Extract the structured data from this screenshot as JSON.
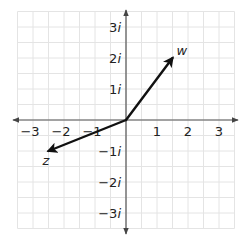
{
  "diagram": {
    "type": "complex-plane",
    "x_range": [
      -3.5,
      3.5
    ],
    "y_range": [
      -3.5,
      3.5
    ],
    "grid_step": 0.5,
    "x_ticks": [
      {
        "value": -3,
        "label": "−3"
      },
      {
        "value": -2,
        "label": "−2"
      },
      {
        "value": -1,
        "label": "−1"
      },
      {
        "value": 1,
        "label": "1"
      },
      {
        "value": 2,
        "label": "2"
      },
      {
        "value": 3,
        "label": "3"
      }
    ],
    "y_ticks": [
      {
        "value": 3,
        "coef": "3",
        "unit": "i"
      },
      {
        "value": 2,
        "coef": "2",
        "unit": "i"
      },
      {
        "value": 1,
        "coef": "1",
        "unit": "i"
      },
      {
        "value": -1,
        "coef": "−1",
        "unit": "i"
      },
      {
        "value": -2,
        "coef": "−2",
        "unit": "i"
      },
      {
        "value": -3,
        "coef": "−3",
        "unit": "i"
      }
    ],
    "vectors": [
      {
        "name": "w",
        "label": "w",
        "re": 1.5,
        "im": 2
      },
      {
        "name": "z",
        "label": "z",
        "re": -2.5,
        "im": -1
      }
    ],
    "colors": {
      "grid": "#e4e4e4",
      "axis": "#555555",
      "vector": "#111111",
      "text": "#222222"
    }
  }
}
